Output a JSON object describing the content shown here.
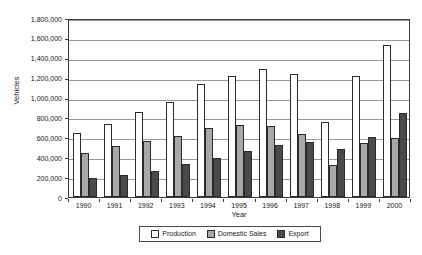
{
  "chart_data": {
    "type": "bar",
    "title": "",
    "xlabel": "Year",
    "ylabel": "Vehicles",
    "categories": [
      "1990",
      "1991",
      "1992",
      "1993",
      "1994",
      "1995",
      "1996",
      "1997",
      "1998",
      "1999",
      "2000"
    ],
    "series": [
      {
        "name": "Production",
        "color": "#ffffff",
        "values": [
          645000,
          730000,
          855000,
          955000,
          1135000,
          1215000,
          1285000,
          1240000,
          755000,
          1220000,
          1530000
        ]
      },
      {
        "name": "Domestic Sales",
        "color": "#a8a8a8",
        "values": [
          445000,
          510000,
          560000,
          610000,
          690000,
          725000,
          710000,
          630000,
          320000,
          540000,
          590000
        ]
      },
      {
        "name": "Export",
        "color": "#4a4a4a",
        "values": [
          195000,
          225000,
          265000,
          330000,
          395000,
          460000,
          525000,
          550000,
          480000,
          600000,
          840000
        ]
      }
    ],
    "ylim": [
      0,
      1800000
    ],
    "ytick_values": [
      0,
      200000,
      400000,
      600000,
      800000,
      1000000,
      1200000,
      1400000,
      1600000,
      1800000
    ],
    "ytick_labels": [
      "0",
      "200,000",
      "400,000",
      "600,000",
      "800,000",
      "1,000,000",
      "1,200,000",
      "1,400,000",
      "1,600,000",
      "1,800,000"
    ],
    "grid": true,
    "legend_position": "bottom"
  }
}
